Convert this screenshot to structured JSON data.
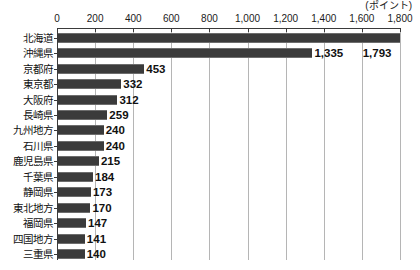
{
  "chart_data": {
    "type": "bar",
    "orientation": "horizontal",
    "title": "",
    "subtitle": "",
    "unit_label": "(ポイント)",
    "xlabel": "",
    "ylabel": "",
    "xlim": [
      0,
      1800
    ],
    "xticks": [
      0,
      200,
      400,
      600,
      800,
      1000,
      1200,
      1400,
      1600,
      1800
    ],
    "xtick_labels": [
      "0",
      "200",
      "400",
      "600",
      "800",
      "1,000",
      "1,200",
      "1,400",
      "1,600",
      "1,800"
    ],
    "grid": true,
    "grid_axis": "x",
    "legend": false,
    "bar_color": "#3b3b3b",
    "categories": [
      "北海道",
      "沖縄県",
      "京都府",
      "東京都",
      "大阪府",
      "長崎県",
      "九州地方",
      "石川県",
      "鹿児島県",
      "千葉県",
      "静岡県",
      "東北地方",
      "福岡県",
      "四国地方",
      "三重県"
    ],
    "values": [
      1793,
      1335,
      453,
      332,
      312,
      259,
      240,
      240,
      215,
      184,
      173,
      170,
      147,
      141,
      140
    ],
    "value_labels": [
      "1,793",
      "1,335",
      "453",
      "332",
      "312",
      "259",
      "240",
      "240",
      "215",
      "184",
      "173",
      "170",
      "147",
      "141",
      "140"
    ],
    "data_label_notes": {
      "0": "label for 北海道 (1,793) is printed one row lower, right-aligned below the bar end"
    }
  }
}
